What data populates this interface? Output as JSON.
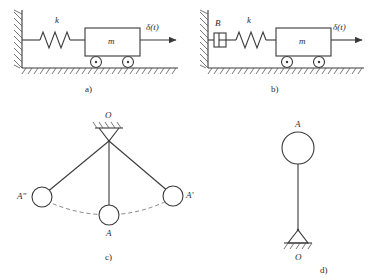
{
  "figure": {
    "panels": [
      {
        "id": "a",
        "caption": "a)",
        "type": "spring-mass-cart",
        "labels": {
          "spring": "k",
          "mass": "m",
          "force": "δ(t)"
        }
      },
      {
        "id": "b",
        "caption": "b)",
        "type": "damper-spring-mass-cart",
        "labels": {
          "damper": "B",
          "spring": "k",
          "mass": "m",
          "force": "δ(t)"
        }
      },
      {
        "id": "c",
        "caption": "c)",
        "type": "simple-pendulum-swing",
        "labels": {
          "pivot": "O",
          "bob_left": "A″",
          "bob_center": "A",
          "bob_right": "A′"
        }
      },
      {
        "id": "d",
        "caption": "d)",
        "type": "inverted-pendulum",
        "labels": {
          "bob": "A",
          "pivot": "O"
        }
      }
    ]
  },
  "colors": {
    "line": "#3a3a3a",
    "hatch": "#555555",
    "dashed": "#777777",
    "background": "#ffffff"
  }
}
